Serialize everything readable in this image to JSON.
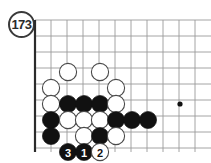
{
  "figure": {
    "label": "173",
    "icon": "circled-number-badge"
  },
  "board": {
    "type": "go-board-diagram",
    "description": "Bottom-left corner of a Go board",
    "grid": {
      "origin_x": 35,
      "origin_y": 20,
      "spacing": 16,
      "cols": 11,
      "rows": 9,
      "edge_left_x": 35,
      "edge_bottom_y": 152,
      "line_color": "#9a9a9a",
      "edge_color": "#2b2b2b",
      "background": "#ffffff"
    },
    "star_points": [
      {
        "name": "hoshi",
        "x": 180,
        "y": 104
      }
    ],
    "stone_radius": 8.6,
    "colors": {
      "black": "#111111",
      "white": "#ffffff",
      "white_outline": "#4a4a4a",
      "number_on_black": "#ffffff",
      "number_on_white": "#111111"
    },
    "stones": [
      {
        "color": "white",
        "x": 68,
        "y": 72,
        "label": ""
      },
      {
        "color": "white",
        "x": 100,
        "y": 72,
        "label": ""
      },
      {
        "color": "white",
        "x": 51,
        "y": 88,
        "label": ""
      },
      {
        "color": "white",
        "x": 116,
        "y": 88,
        "label": ""
      },
      {
        "color": "white",
        "x": 51,
        "y": 104,
        "label": ""
      },
      {
        "color": "black",
        "x": 68,
        "y": 104,
        "label": ""
      },
      {
        "color": "black",
        "x": 84,
        "y": 104,
        "label": ""
      },
      {
        "color": "black",
        "x": 100,
        "y": 104,
        "label": ""
      },
      {
        "color": "white",
        "x": 116,
        "y": 104,
        "label": ""
      },
      {
        "color": "black",
        "x": 51,
        "y": 120,
        "label": ""
      },
      {
        "color": "white",
        "x": 68,
        "y": 120,
        "label": ""
      },
      {
        "color": "white",
        "x": 84,
        "y": 120,
        "label": ""
      },
      {
        "color": "white",
        "x": 100,
        "y": 120,
        "label": ""
      },
      {
        "color": "black",
        "x": 116,
        "y": 120,
        "label": ""
      },
      {
        "color": "black",
        "x": 132,
        "y": 120,
        "label": ""
      },
      {
        "color": "black",
        "x": 148,
        "y": 120,
        "label": ""
      },
      {
        "color": "black",
        "x": 51,
        "y": 136,
        "label": ""
      },
      {
        "color": "white",
        "x": 84,
        "y": 136,
        "label": ""
      },
      {
        "color": "black",
        "x": 100,
        "y": 136,
        "label": ""
      },
      {
        "color": "white",
        "x": 116,
        "y": 136,
        "label": ""
      },
      {
        "color": "black",
        "x": 68,
        "y": 152,
        "label": "3"
      },
      {
        "color": "black",
        "x": 84,
        "y": 152,
        "label": "1"
      },
      {
        "color": "white",
        "x": 100,
        "y": 152,
        "label": "2"
      }
    ],
    "move_sequence": [
      {
        "number": "1",
        "color": "black"
      },
      {
        "number": "2",
        "color": "white"
      },
      {
        "number": "3",
        "color": "black"
      }
    ]
  }
}
